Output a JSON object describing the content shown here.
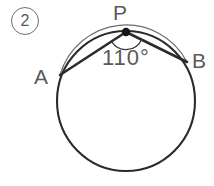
{
  "figure": {
    "type": "circle-geometry-inscribed-angle",
    "problem_number": "2",
    "background_color": "#ffffff",
    "stroke_color": "#2b2b2b",
    "arc_stroke_color": "#4a4a4a",
    "label_color": "#5a5a5a",
    "circle": {
      "center_x": 126,
      "center_y": 101,
      "radius_x": 69,
      "radius_y": 70,
      "stroke_width": 2.1
    },
    "points": [
      {
        "name": "P",
        "label": "P",
        "x": 126,
        "y": 32,
        "marker": "filled-dot",
        "marker_radius": 4.2
      },
      {
        "name": "A",
        "label": "A",
        "x": 60,
        "y": 75,
        "marker": "none"
      },
      {
        "name": "B",
        "label": "B",
        "x": 187,
        "y": 62,
        "marker": "none"
      }
    ],
    "chords": [
      {
        "name": "chord-PA",
        "from": "P",
        "to": "A",
        "stroke_width": 2.6
      },
      {
        "name": "chord-PB",
        "from": "P",
        "to": "B",
        "stroke_width": 2.6
      }
    ],
    "angle": {
      "vertex": "P",
      "value": "110",
      "unit": "°",
      "label": "110°",
      "arc_radius": 17,
      "arc_stroke_width": 1.3
    },
    "labels": {
      "P": "P",
      "A": "A",
      "B": "B",
      "angle": "110°",
      "problem_number": "2"
    }
  }
}
